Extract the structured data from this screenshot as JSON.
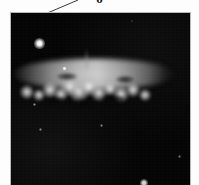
{
  "figure": {
    "kind": "astronomical-photograph",
    "background_color": "#fdfdfd",
    "sky_color": "#050505",
    "frame_border_color": "#b8b8b8",
    "top_glyph": "o"
  },
  "callout": {
    "name": "leader-line",
    "color": "#3a3a3a",
    "x1": 78,
    "y1": 0,
    "x2": 38,
    "y2": 17,
    "width": 1
  },
  "photo": {
    "left": 10,
    "top": 12,
    "width": 181,
    "height": 177
  },
  "galaxy": {
    "label": "edge-on spiral galaxy disk",
    "center_x": 93,
    "center_y": 73,
    "major_axis": 170,
    "minor_axis": 62,
    "position_angle_deg": 0,
    "core_color": "#d8d8d8",
    "halo_color": "#8a8a8a",
    "knots": [
      {
        "x": 18,
        "y": 49,
        "r": 7,
        "name": "knot-w-outer"
      },
      {
        "x": 30,
        "y": 52,
        "r": 6,
        "name": "knot-w"
      },
      {
        "x": 41,
        "y": 47,
        "r": 8,
        "name": "knot-wc"
      },
      {
        "x": 52,
        "y": 51,
        "r": 7,
        "name": "knot-c-west"
      },
      {
        "x": 61,
        "y": 44,
        "r": 9,
        "name": "knot-core-a"
      },
      {
        "x": 70,
        "y": 49,
        "r": 10,
        "name": "knot-core-b"
      },
      {
        "x": 80,
        "y": 44,
        "r": 9,
        "name": "knot-core-c"
      },
      {
        "x": 90,
        "y": 50,
        "r": 8,
        "name": "knot-core-d"
      },
      {
        "x": 101,
        "y": 46,
        "r": 7,
        "name": "knot-e-inner"
      },
      {
        "x": 112,
        "y": 51,
        "r": 8,
        "name": "knot-e"
      },
      {
        "x": 124,
        "y": 47,
        "r": 7,
        "name": "knot-e-outer"
      },
      {
        "x": 136,
        "y": 52,
        "r": 6,
        "name": "knot-e-far"
      }
    ],
    "dust_lanes": [
      {
        "x": 46,
        "y": 58,
        "w": 26,
        "h": 9,
        "name": "dust-lane-west"
      },
      {
        "x": 74,
        "y": 60,
        "w": 22,
        "h": 8,
        "name": "dust-lane-center"
      },
      {
        "x": 104,
        "y": 56,
        "w": 24,
        "h": 9,
        "name": "dust-lane-east"
      },
      {
        "x": 58,
        "y": 33,
        "w": 20,
        "h": 7,
        "name": "dust-lane-north"
      },
      {
        "x": 116,
        "y": 36,
        "w": 18,
        "h": 7,
        "name": "dust-lane-ne"
      }
    ],
    "wisps": [
      {
        "x": 76,
        "y": 4,
        "w": 3,
        "h": 22,
        "name": "outflow-filament"
      }
    ]
  },
  "stars": [
    {
      "name": "bright-foreground-star",
      "x": 38,
      "y": 42,
      "size": 11,
      "brightness": 1.0
    },
    {
      "name": "star-small-upper",
      "x": 63,
      "y": 67,
      "size": 5,
      "brightness": 0.9
    },
    {
      "name": "star-lower-left-a",
      "x": 33,
      "y": 103,
      "size": 3,
      "brightness": 0.55
    },
    {
      "name": "star-lower-left-b",
      "x": 39,
      "y": 128,
      "size": 3,
      "brightness": 0.5
    },
    {
      "name": "star-lower-center",
      "x": 100,
      "y": 124,
      "size": 3,
      "brightness": 0.5
    },
    {
      "name": "star-lower-right",
      "x": 178,
      "y": 155,
      "size": 3,
      "brightness": 0.45
    },
    {
      "name": "star-bottom-edge",
      "x": 143,
      "y": 182,
      "size": 8,
      "brightness": 0.85
    },
    {
      "name": "star-faint-top",
      "x": 131,
      "y": 20,
      "size": 2,
      "brightness": 0.3
    }
  ]
}
